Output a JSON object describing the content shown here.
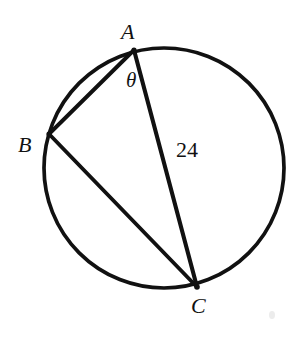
{
  "figure": {
    "type": "circle-geometry-diagram",
    "background_color": "#ffffff",
    "stroke_color": "#111111",
    "stroke_width": 3.6,
    "canvas": {
      "width": 301,
      "height": 338
    }
  },
  "circle": {
    "name": "circumscribed-circle",
    "center_x": 164,
    "center_y": 168,
    "radius": 120
  },
  "points": [
    {
      "id": "A",
      "label": "A",
      "x": 134,
      "y": 50
    },
    {
      "id": "B",
      "label": "B",
      "x": 49,
      "y": 134
    },
    {
      "id": "C",
      "label": "C",
      "x": 197,
      "y": 287
    }
  ],
  "segments": [
    {
      "id": "AB",
      "from": "A",
      "to": "B",
      "label": ""
    },
    {
      "id": "AC",
      "from": "A",
      "to": "C",
      "label": "24"
    },
    {
      "id": "BC",
      "from": "B",
      "to": "C",
      "label": ""
    }
  ],
  "annotations": {
    "angle": {
      "name": "inscribed-angle-at-A",
      "symbol": "θ",
      "vertex": "A",
      "x": 131,
      "y": 80
    },
    "measure": {
      "name": "segment-length-AC",
      "value": "24",
      "x": 187,
      "y": 150
    }
  },
  "labels": {
    "point_a": "A",
    "point_b": "B",
    "point_c": "C",
    "theta": "θ",
    "length_ac": "24"
  }
}
